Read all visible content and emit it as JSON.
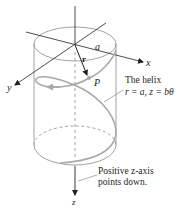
{
  "figure": {
    "colors": {
      "axis": "#231f20",
      "cylinder": "#8a8a8a",
      "helix": "#a7a9ac",
      "vector": "#231f20",
      "background": "#ffffff"
    },
    "labels": {
      "x_axis": "x",
      "y_axis": "y",
      "z_axis": "z",
      "radius": "a",
      "vector": "r",
      "point": "P",
      "helix_title": "The helix",
      "helix_equation": "r = a, z = bθ",
      "z_note_line1": "Positive z-axis",
      "z_note_line2": "points down."
    }
  }
}
